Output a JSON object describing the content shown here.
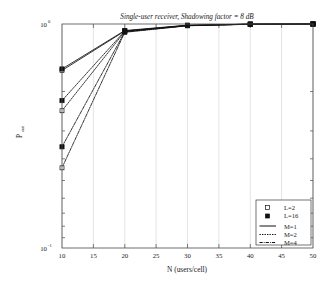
{
  "chart_data": {
    "type": "line",
    "title": "Single-user receiver, Shadowing factor = 8 dB",
    "xlabel": "N (users/cell)",
    "ylabel": "P_out",
    "ylabel_base": "P",
    "ylabel_sub": "out",
    "xlim": [
      10,
      50
    ],
    "ylim": [
      0.1,
      1.0
    ],
    "yscale": "log",
    "xscale": "linear",
    "grid": "vertical-only",
    "legend_position": "bottom-right",
    "xticks": [
      10,
      15,
      20,
      25,
      30,
      35,
      40,
      45,
      50
    ],
    "xtick_labels": [
      "10",
      "15",
      "20",
      "25",
      "30",
      "35",
      "40",
      "45",
      "50"
    ],
    "yticks": [
      0.1,
      1.0
    ],
    "ytick_labels": [
      "10^-1",
      "10^0"
    ],
    "ytick_mantissa": [
      "10",
      "10"
    ],
    "ytick_exponent": [
      "-1",
      "0"
    ],
    "x": [
      10,
      20,
      30,
      40,
      50
    ],
    "series": [
      {
        "name": "M=1, L=2",
        "marker": "open-square",
        "linestyle": "solid",
        "values": [
          0.62,
          0.93,
          0.985,
          0.998,
          1.0
        ]
      },
      {
        "name": "M=1, L=16",
        "marker": "filled-square",
        "linestyle": "solid",
        "values": [
          0.63,
          0.935,
          0.988,
          0.999,
          1.0
        ]
      },
      {
        "name": "M=2, L=2",
        "marker": "open-square",
        "linestyle": "dotted",
        "values": [
          0.41,
          0.925,
          0.984,
          0.998,
          1.0
        ]
      },
      {
        "name": "M=2, L=16",
        "marker": "filled-square",
        "linestyle": "dotted",
        "values": [
          0.455,
          0.93,
          0.986,
          0.998,
          1.0
        ]
      },
      {
        "name": "M=4, L=2",
        "marker": "open-square",
        "linestyle": "dashdot",
        "values": [
          0.228,
          0.918,
          0.982,
          0.997,
          1.0
        ]
      },
      {
        "name": "M=4, L=16",
        "marker": "filled-square",
        "linestyle": "dashdot",
        "values": [
          0.283,
          0.922,
          0.983,
          0.998,
          1.0
        ]
      }
    ],
    "legend": [
      {
        "label": "L=2",
        "type": "marker",
        "marker": "open-square"
      },
      {
        "label": "L=16",
        "type": "marker",
        "marker": "filled-square"
      },
      {
        "label": "M=1",
        "type": "line",
        "linestyle": "solid"
      },
      {
        "label": "M=2",
        "type": "line",
        "linestyle": "dotted"
      },
      {
        "label": "M=4",
        "type": "line",
        "linestyle": "dashdot"
      }
    ]
  }
}
